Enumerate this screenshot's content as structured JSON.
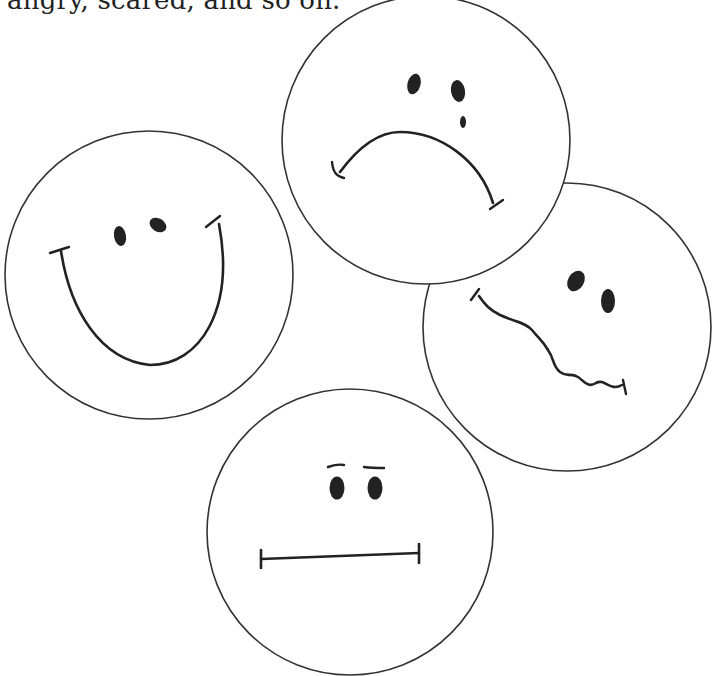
{
  "document": {
    "caption_text": "angry, scared, and so on."
  },
  "illustration": {
    "description": "Four hand-drawn emotion faces in circles",
    "stroke_color": "#222222",
    "fill_color": "#ffffff",
    "faces": [
      {
        "name": "happy",
        "emotion": "happy",
        "cx": 149,
        "cy": 275,
        "r": 144
      },
      {
        "name": "sad",
        "emotion": "sad-crying",
        "cx": 426,
        "cy": 140,
        "r": 144
      },
      {
        "name": "wavy",
        "emotion": "scared",
        "cx": 567,
        "cy": 327,
        "r": 144
      },
      {
        "name": "neutral",
        "emotion": "neutral",
        "cx": 350,
        "cy": 532,
        "r": 143
      }
    ]
  }
}
